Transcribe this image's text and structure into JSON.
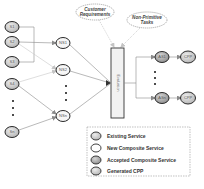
{
  "diagram": {
    "existing_services": [
      {
        "id": "S1",
        "label": "S1",
        "x": 12,
        "y": 27
      },
      {
        "id": "S2",
        "label": "S2",
        "x": 12,
        "y": 42
      },
      {
        "id": "S3",
        "label": "S3",
        "x": 12,
        "y": 62
      },
      {
        "id": "S4",
        "label": "S4",
        "x": 12,
        "y": 84
      },
      {
        "id": "Sn",
        "label": "Sn",
        "x": 12,
        "y": 132
      }
    ],
    "new_composite_services": [
      {
        "id": "NS1",
        "label": "NS1",
        "x": 63,
        "y": 43
      },
      {
        "id": "NS2",
        "label": "NS2",
        "x": 63,
        "y": 70
      },
      {
        "id": "NSn",
        "label": "NSn",
        "x": 63,
        "y": 116
      }
    ],
    "accepted_composite_services": [
      {
        "id": "AS1",
        "label": "AS1",
        "x": 162,
        "y": 57
      },
      {
        "id": "ASn",
        "label": "ASn",
        "x": 162,
        "y": 98
      }
    ],
    "generated_cpp": [
      {
        "id": "CPP1",
        "label": "CPP",
        "x": 188,
        "y": 57
      },
      {
        "id": "CPPn",
        "label": "CPP",
        "x": 188,
        "y": 98
      }
    ],
    "evaluation": {
      "label": "Evaluation"
    },
    "inputs": {
      "customer_requirements": {
        "line1": "Customer",
        "line2": "Requirements"
      },
      "non_primitive_tasks": {
        "line1": "Non-Primitive",
        "line2": "Tasks"
      }
    },
    "ellipsis_marker": "⋮"
  },
  "legend": {
    "items": [
      {
        "label": "Existing Service",
        "fill": "#c8c8c8"
      },
      {
        "label": "New Composite Service",
        "fill": "#ffffff"
      },
      {
        "label": "Accepted Composite Service",
        "fill": "#a8a8a8"
      },
      {
        "label": "Generated CPP",
        "fill": "#b4b4b4"
      }
    ]
  },
  "colors": {
    "node_stroke": "#2a2a2a",
    "existing_fill": "#cfcfcf",
    "new_fill": "#f4f4f4",
    "accepted_fill": "#a9a9a9",
    "cpp_fill": "#b9b9b9",
    "edge": "#8a8a8a",
    "dashed": "#b0b0b0"
  }
}
